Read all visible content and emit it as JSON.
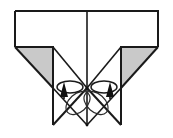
{
  "figure": {
    "title": "Origami fold step diagram",
    "type": "paper-folding-instruction",
    "canvas": {
      "width": 173,
      "height": 138,
      "background": "#ffffff"
    },
    "colors": {
      "outline": "#1a1a1a",
      "paper_front": "#ffffff",
      "paper_back_shaded": "#c9c9c9",
      "crease_line": "#2b2b2b",
      "arrow": "#111111"
    },
    "caption": "",
    "step_number": ""
  },
  "shapes": {
    "body": {
      "name": "folded-paper-body",
      "description": "Wide rectangle on top narrowing to a central inverted V with two downward flaps",
      "outline_points": "15,11 158,11 158,47 121,47 121,88 158,47 121,88 87,88 53,88 15,47 53,47 53,11"
    },
    "top_rectangle": {
      "name": "top-panel",
      "x": 15,
      "y": 11,
      "width": 143,
      "height": 36
    },
    "shaded_triangle_left": {
      "name": "left-shaded-flap",
      "points": "15,47 53,47 53,88",
      "fill": "#c9c9c9"
    },
    "shaded_triangle_right": {
      "name": "right-shaded-flap",
      "points": "158,47 121,47 121,88",
      "fill": "#c9c9c9"
    },
    "center_vertical_crease": {
      "name": "center-crease",
      "x": 87,
      "y1": 11,
      "y2": 125
    },
    "left_flap_leg": {
      "name": "left-flap-leg",
      "x": 53,
      "y1": 88,
      "y2": 125
    },
    "right_flap_leg": {
      "name": "right-flap-leg",
      "x": 121,
      "y1": 88,
      "y2": 125
    },
    "convergence_point": {
      "name": "apex-point",
      "x": 87,
      "y": 88
    }
  },
  "annotations": {
    "arrows": [
      {
        "name": "left-fold-arrow",
        "kind": "push-in-arrow",
        "direction": "up",
        "tip_x": 64,
        "tip_y": 84,
        "tail_x": 64,
        "tail_y": 99,
        "has_loop": true,
        "loop_cx": 70,
        "loop_cy": 87,
        "loop_rx": 13,
        "loop_ry": 6
      },
      {
        "name": "right-fold-arrow",
        "kind": "push-in-arrow",
        "direction": "up",
        "tip_x": 110,
        "tip_y": 84,
        "tail_x": 110,
        "tail_y": 99,
        "has_loop": true,
        "loop_cx": 104,
        "loop_cy": 87,
        "loop_rx": 13,
        "loop_ry": 6
      }
    ],
    "guide_ellipses": [
      {
        "name": "left-guide-ellipse",
        "cx": 78,
        "cy": 103,
        "rx": 14,
        "ry": 9,
        "rotate": -42
      },
      {
        "name": "right-guide-ellipse",
        "cx": 96,
        "cy": 103,
        "rx": 14,
        "ry": 9,
        "rotate": 42
      }
    ],
    "creases": [
      {
        "name": "left-diagonal-crease",
        "x1": 53,
        "y1": 88,
        "x2": 87,
        "y2": 125
      },
      {
        "name": "right-diagonal-crease",
        "x1": 121,
        "y1": 88,
        "x2": 87,
        "y2": 125
      },
      {
        "name": "left-inner-diagonal",
        "x1": 87,
        "y1": 88,
        "x2": 53,
        "y2": 125
      },
      {
        "name": "right-inner-diagonal",
        "x1": 87,
        "y1": 88,
        "x2": 121,
        "y2": 125
      },
      {
        "name": "left-upper-diagonal",
        "x1": 15,
        "y1": 47,
        "x2": 87,
        "y2": 88
      },
      {
        "name": "right-upper-diagonal",
        "x1": 158,
        "y1": 47,
        "x2": 87,
        "y2": 88
      },
      {
        "name": "left-flap-edge",
        "x1": 53,
        "y1": 47,
        "x2": 87,
        "y2": 88
      },
      {
        "name": "right-flap-edge",
        "x1": 121,
        "y1": 47,
        "x2": 87,
        "y2": 88
      }
    ]
  },
  "labels": {
    "none_visible": ""
  }
}
